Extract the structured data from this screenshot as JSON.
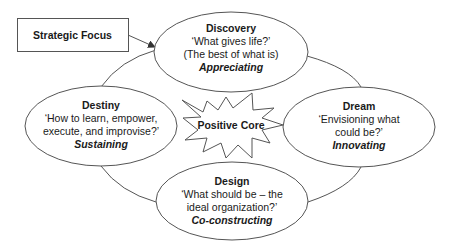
{
  "diagram": {
    "strategic_focus": {
      "label": "Strategic Focus"
    },
    "core": {
      "label": "Positive Core"
    },
    "phases": {
      "discovery": {
        "title": "Discovery",
        "line1": "‘What gives life?’",
        "line2": "(The best of what is)",
        "mode": "Appreciating"
      },
      "dream": {
        "title": "Dream",
        "line1": "‘Envisioning what",
        "line2": "could be?’",
        "mode": "Innovating"
      },
      "design": {
        "title": "Design",
        "line1": "‘What should be – the",
        "line2": "ideal organization?’",
        "mode": "Co-constructing"
      },
      "destiny": {
        "title": "Destiny",
        "line1": "‘How to learn, empower,",
        "line2": "execute, and improvise?’",
        "mode": "Sustaining"
      }
    },
    "colors": {
      "stroke": "#555555",
      "text": "#1a1a1a",
      "background": "#ffffff"
    }
  }
}
